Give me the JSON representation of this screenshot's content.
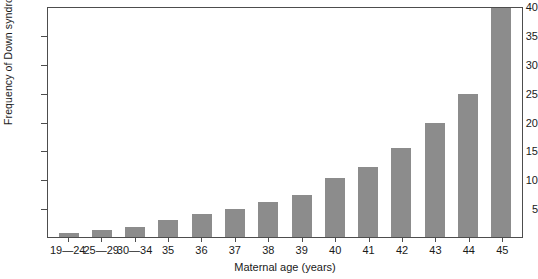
{
  "chart_data": {
    "type": "bar",
    "title": "",
    "xlabel": "Maternal age (years)",
    "ylabel": "Frequency of Down syndrome per 1,000 live births",
    "categories": [
      "19—24",
      "25—29",
      "30—34",
      "35",
      "36",
      "37",
      "38",
      "39",
      "40",
      "41",
      "42",
      "43",
      "44",
      "45"
    ],
    "values": [
      0.7,
      1.3,
      1.7,
      3.0,
      3.9,
      4.8,
      6.1,
      7.3,
      10.2,
      12.2,
      15.4,
      19.7,
      24.7,
      41.5
    ],
    "clipped_bars": [
      "45"
    ],
    "ylim": [
      0,
      40
    ],
    "yticks": [
      5,
      10,
      15,
      20,
      25,
      30,
      35,
      40
    ],
    "ytick_labels": [
      "5",
      "10",
      "15",
      "20",
      "25",
      "30",
      "35",
      "40"
    ],
    "grid": false,
    "legend": null,
    "bar_color": "#8c8c8c",
    "axis_color": "#4d4d4d",
    "background_color": "#ffffff"
  }
}
